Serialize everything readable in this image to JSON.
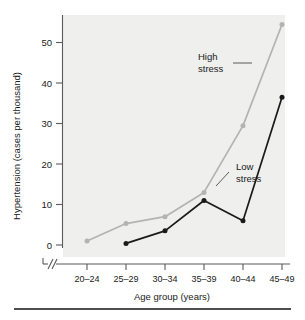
{
  "chart_data": {
    "type": "line",
    "title": "",
    "xlabel": "Age group (years)",
    "ylabel": "Hypertension (cases per thousand)",
    "categories": [
      "20–24",
      "25–29",
      "30–34",
      "35–39",
      "40–44",
      "45–49"
    ],
    "ylim": [
      0,
      55
    ],
    "yticks": [
      0,
      10,
      20,
      30,
      40,
      50
    ],
    "ytick_labels": [
      "0",
      "10",
      "20",
      "30",
      "40",
      "50"
    ],
    "grid": false,
    "legend_position": "inline-annotations",
    "axis_break": "//",
    "series": [
      {
        "name": "High stress",
        "color": "#b3b3b3",
        "marker": "circle",
        "values": [
          1,
          5.3,
          7,
          13,
          29.5,
          54.5
        ]
      },
      {
        "name": "Low stress",
        "color": "#1a1a1a",
        "marker": "circle",
        "values": [
          null,
          0.4,
          3.5,
          11,
          6,
          36.5
        ]
      }
    ],
    "annotations": [
      {
        "id": "high-stress",
        "line1": "High",
        "line2": "stress",
        "target_series": "High stress"
      },
      {
        "id": "low-stress",
        "line1": "Low",
        "line2": "stress",
        "target_series": "Low stress"
      }
    ]
  },
  "figure": {
    "plot_background_color": "#efefed",
    "axis_color": "#5a5a5a",
    "bottom_rule_color": "#4d4d4d"
  }
}
